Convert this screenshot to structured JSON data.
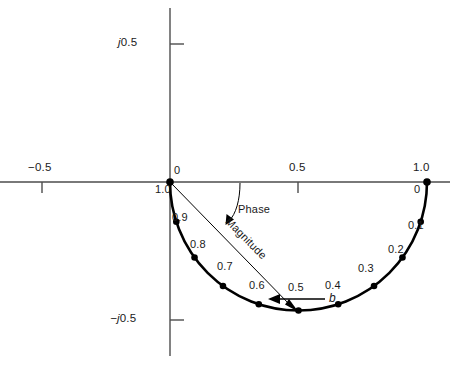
{
  "chart_data": {
    "type": "line",
    "title": "",
    "subtitle": "",
    "xlabel": "",
    "ylabel": "",
    "xlim": [
      -0.66,
      1.09
    ],
    "ylim": [
      -0.63,
      0.635
    ],
    "grid": false,
    "legend": null,
    "locus": {
      "shape": "semicircle",
      "center": [
        0.5,
        0.0
      ],
      "radius": 0.5,
      "half": "lower",
      "parameter_name": "b",
      "parameter_direction": "increasing b travels right-to-left (clockwise from 1.0 toward 0)"
    },
    "axis_ticks": {
      "real": [
        {
          "value": -0.5,
          "label": "−0.5"
        },
        {
          "value": 0.5,
          "label": "0.5"
        },
        {
          "value": 1.0,
          "label": "1.0"
        }
      ],
      "imag": [
        {
          "value": 0.5,
          "label": "j0.5"
        },
        {
          "value": -0.5,
          "label": "−j0.5"
        }
      ]
    },
    "points": [
      {
        "label": "0",
        "b": 0.0,
        "re": 1.0,
        "im": 0.0
      },
      {
        "label": "0.1",
        "b": 0.1,
        "re": 0.9045,
        "im": -0.2939
      },
      {
        "label": "0.2",
        "b": 0.2,
        "re": 0.6545,
        "im": -0.4755
      },
      {
        "label": "0.3",
        "b": 0.3,
        "re": 0.3455,
        "im": -0.4755
      },
      {
        "label": "0.4",
        "b": 0.4,
        "re": 0.0955,
        "im": -0.2939
      },
      {
        "label": "0.5",
        "b": 0.5,
        "re": 0.5,
        "im": -0.5
      },
      {
        "label": "0.6",
        "b": 0.6,
        "re": 0.3455,
        "im": -0.4755
      },
      {
        "label": "0.7",
        "b": 0.7,
        "re": 0.2061,
        "im": -0.4045
      },
      {
        "label": "0.8",
        "b": 0.8,
        "re": 0.0955,
        "im": -0.2939
      },
      {
        "label": "0.9",
        "b": 0.9,
        "re": 0.0245,
        "im": -0.1545
      },
      {
        "label": "1.0",
        "b": 1.0,
        "re": 0.0,
        "im": 0.0
      }
    ]
  },
  "axes": {
    "tick_minus_half": "−0.5",
    "tick_half": "0.5",
    "tick_one": "1.0",
    "tick_j_half": "j0.5",
    "tick_neg_j_half": "−j0.5",
    "j_prefix": "j",
    "j_value": "0.5",
    "neg_j_prefix": "−j",
    "neg_j_value": "0.5"
  },
  "point_labels": {
    "origin_top": "0",
    "origin_bottom": "1.0",
    "right_top": "1.0",
    "right_bottom": "0",
    "p01": "0.1",
    "p02": "0.2",
    "p03": "0.3",
    "p04": "0.4",
    "p05": "0.5",
    "p06": "0.6",
    "p07": "0.7",
    "p08": "0.8",
    "p09": "0.9"
  },
  "annotations": {
    "phase": "Phase",
    "magnitude": "Magnitude",
    "direction_symbol": "b"
  },
  "colors": {
    "curve": "#000000",
    "axis": "#4d4d4d",
    "text": "#1a1a1a",
    "marker": "#000000",
    "annotation_line": "#000000",
    "background": "#ffffff"
  }
}
